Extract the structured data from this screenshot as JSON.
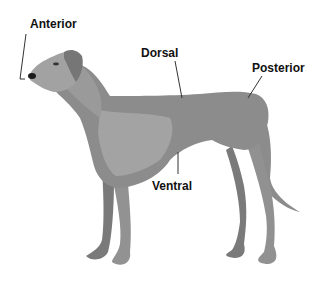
{
  "diagram": {
    "labels": {
      "anterior": "Anterior",
      "dorsal": "Dorsal",
      "posterior": "Posterior",
      "ventral": "Ventral"
    },
    "colors": {
      "body": "#8c8c8c",
      "body_light": "#a6a6a6",
      "body_dark": "#6e6e6e",
      "nose": "#1a1a1a",
      "text": "#111111",
      "leader_line": "#333333",
      "background": "#ffffff"
    }
  }
}
